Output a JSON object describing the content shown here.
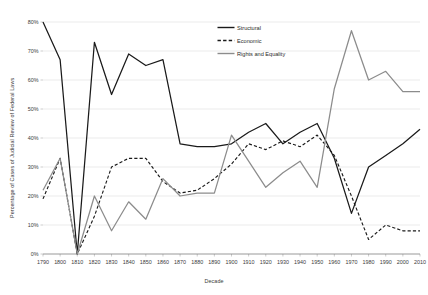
{
  "chart_data": {
    "type": "line",
    "title": "",
    "xlabel": "Decade",
    "ylabel": "Percentage of Cases of Judicial Review of Federal Laws",
    "categories": [
      "1790",
      "1800",
      "1810",
      "1820",
      "1830",
      "1840",
      "1850",
      "1860",
      "1870",
      "1880",
      "1890",
      "1900",
      "1910",
      "1920",
      "1930",
      "1940",
      "1950",
      "1960",
      "1970",
      "1980",
      "1990",
      "2000",
      "2010"
    ],
    "x": [
      1790,
      1800,
      1810,
      1820,
      1830,
      1840,
      1850,
      1860,
      1870,
      1880,
      1890,
      1900,
      1910,
      1920,
      1930,
      1940,
      1950,
      1960,
      1970,
      1980,
      1990,
      2000,
      2010
    ],
    "xlim": [
      1790,
      2010
    ],
    "ylim": [
      0,
      80
    ],
    "ytick_labels": [
      "0%",
      "10%",
      "20%",
      "30%",
      "40%",
      "50%",
      "60%",
      "70%",
      "80%"
    ],
    "yticks": [
      0,
      10,
      20,
      30,
      40,
      50,
      60,
      70,
      80
    ],
    "grid": "horizontal",
    "legend_position": "top-center",
    "series": [
      {
        "name": "Structural",
        "style": "solid",
        "color": "#1a1a1a",
        "values": [
          80,
          67,
          0,
          73,
          55,
          69,
          65,
          67,
          38,
          37,
          37,
          38,
          42,
          45,
          38,
          42,
          45,
          33,
          14,
          30,
          34,
          38,
          43
        ]
      },
      {
        "name": "Economic",
        "style": "dashed",
        "color": "#1a1a1a",
        "values": [
          19,
          33,
          0,
          13,
          30,
          33,
          33,
          25,
          21,
          22,
          26,
          31,
          38,
          36,
          39,
          37,
          41,
          34,
          20,
          5,
          10,
          8,
          8
        ]
      },
      {
        "name": "Rights and Equality",
        "style": "solid",
        "color": "#8c8c8c",
        "values": [
          22,
          33,
          0,
          20,
          8,
          18,
          12,
          26,
          20,
          21,
          21,
          41,
          32,
          23,
          28,
          32,
          23,
          57,
          77,
          60,
          63,
          56,
          56
        ]
      }
    ]
  },
  "legend": {
    "items": [
      {
        "label": "Structural"
      },
      {
        "label": "Economic"
      },
      {
        "label": "Rights and Equality"
      }
    ]
  }
}
